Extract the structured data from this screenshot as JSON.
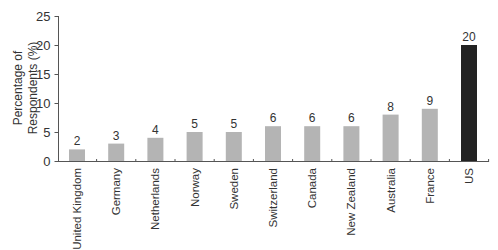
{
  "chart_data": {
    "type": "bar",
    "title": "",
    "xlabel": "",
    "ylabel": "Percentage of Respondents (%)",
    "ylabel_lines": [
      "Percentage of",
      "Respondents (%)"
    ],
    "ylim": [
      0,
      25
    ],
    "yticks": [
      0,
      5,
      10,
      15,
      20,
      25
    ],
    "grid": false,
    "legend": null,
    "categories": [
      "United Kingdom",
      "Germany",
      "Netherlands",
      "Norway",
      "Sweden",
      "Switzerland",
      "Canada",
      "New Zealand",
      "Australia",
      "France",
      "US"
    ],
    "values": [
      2,
      3,
      4,
      5,
      5,
      6,
      6,
      6,
      8,
      9,
      20
    ],
    "value_labels": [
      "2",
      "3",
      "4",
      "5",
      "5",
      "6",
      "6",
      "6",
      "8",
      "9",
      "20"
    ],
    "colors": {
      "default_bar": "#b4b4b4",
      "highlight_bar": "#222222",
      "highlight_category": "US",
      "axis": "#555555"
    }
  }
}
